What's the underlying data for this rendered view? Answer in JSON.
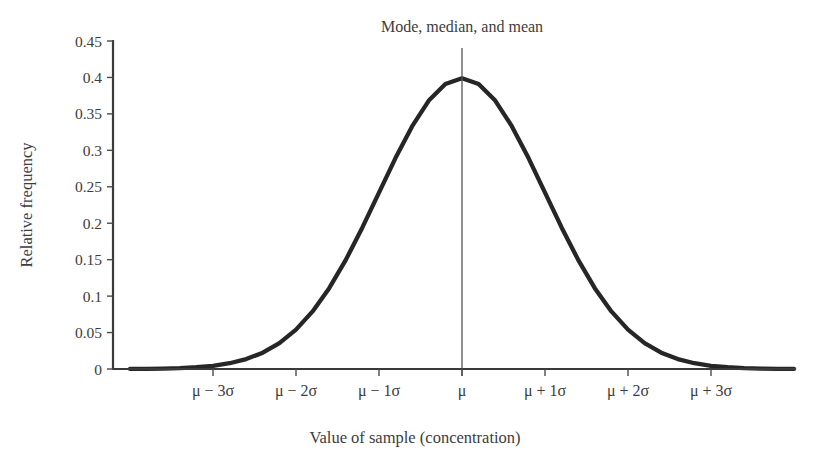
{
  "chart_data": {
    "type": "line",
    "title": "",
    "annotation": "Mode, median, and mean",
    "xlabel": "Value of sample (concentration)",
    "ylabel": "Relative frequency",
    "grid": false,
    "legend": false,
    "distribution": {
      "name": "normal",
      "mean_label": "μ",
      "sigma_label": "σ",
      "peak_value": 0.4,
      "mean_position_sigma": 0
    },
    "x_tick_labels": [
      "μ − 3σ",
      "μ − 2σ",
      "μ − 1σ",
      "μ",
      "μ + 1σ",
      "μ + 2σ",
      "μ + 3σ"
    ],
    "x_tick_sigma_values": [
      -3,
      -2,
      -1,
      0,
      1,
      2,
      3
    ],
    "xlim_sigma": [
      -4.0,
      4.0
    ],
    "y_tick_labels": [
      "0",
      "0.05",
      "0.1",
      "0.15",
      "0.2",
      "0.25",
      "0.3",
      "0.35",
      "0.4",
      "0.45"
    ],
    "y_tick_values": [
      0,
      0.05,
      0.1,
      0.15,
      0.2,
      0.25,
      0.3,
      0.35,
      0.4,
      0.45
    ],
    "ylim": [
      0,
      0.45
    ],
    "series": [
      {
        "name": "Relative frequency",
        "color": "#262626",
        "x_sigma": [
          -4.0,
          -3.8,
          -3.6,
          -3.4,
          -3.2,
          -3.0,
          -2.8,
          -2.6,
          -2.4,
          -2.2,
          -2.0,
          -1.8,
          -1.6,
          -1.4,
          -1.2,
          -1.0,
          -0.8,
          -0.6,
          -0.4,
          -0.2,
          0.0,
          0.2,
          0.4,
          0.6,
          0.8,
          1.0,
          1.2,
          1.4,
          1.6,
          1.8,
          2.0,
          2.2,
          2.4,
          2.6,
          2.8,
          3.0,
          3.2,
          3.4,
          3.6,
          3.8,
          4.0
        ],
        "values": [
          0.0001,
          0.0003,
          0.0006,
          0.0012,
          0.0024,
          0.0044,
          0.0079,
          0.0136,
          0.0224,
          0.0355,
          0.054,
          0.079,
          0.1109,
          0.1497,
          0.1942,
          0.242,
          0.2897,
          0.3332,
          0.3683,
          0.391,
          0.3989,
          0.391,
          0.3683,
          0.3332,
          0.2897,
          0.242,
          0.1942,
          0.1497,
          0.1109,
          0.079,
          0.054,
          0.0355,
          0.0224,
          0.0136,
          0.0079,
          0.0044,
          0.0024,
          0.0012,
          0.0006,
          0.0003,
          0.0001
        ]
      }
    ],
    "markers": [
      {
        "name": "mode-median-mean-line",
        "orientation": "vertical",
        "x_sigma": 0,
        "label": "Mode, median, and mean",
        "color": "#555555"
      }
    ],
    "colors": {
      "curve": "#262626",
      "axis": "#3a3a3a",
      "text": "#3d3d3d",
      "marker": "#555555",
      "background": "#ffffff"
    }
  }
}
